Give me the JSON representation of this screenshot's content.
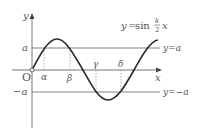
{
  "diagram": {
    "equation": {
      "lhs": "y",
      "eq": "=",
      "func": "sin",
      "frac_num": "k",
      "frac_den": "2",
      "var": "x"
    },
    "axes": {
      "x_label": "x",
      "y_label": "y",
      "origin_label": "O"
    },
    "y_ticks": {
      "pos": "a",
      "neg": "−a"
    },
    "lines": {
      "upper": "y=a",
      "lower": "y=−a"
    },
    "x_points": [
      "α",
      "β",
      "γ",
      "δ"
    ],
    "colors": {
      "curve": "#2a2a2a",
      "axis": "#666666",
      "line": "#777777",
      "dashed": "#999999",
      "text": "#555555"
    }
  }
}
